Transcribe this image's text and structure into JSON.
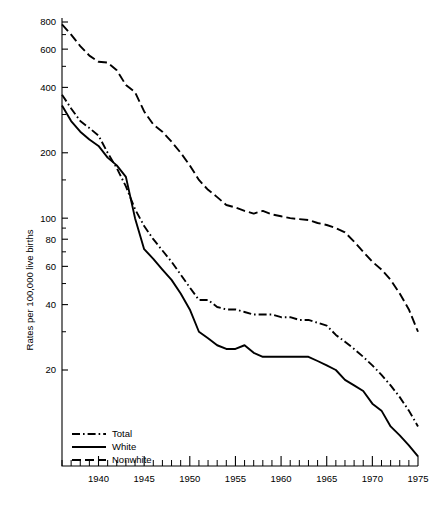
{
  "chart_data": {
    "type": "line",
    "title": "",
    "subtitle": "",
    "xlabel": "",
    "ylabel": "Rates per 100,000 live births",
    "yscale": "log",
    "ylim": [
      14,
      900
    ],
    "xlim": [
      1936,
      1975
    ],
    "grid": false,
    "legend_position": "bottom-left",
    "y_ticks_major": [
      800,
      600,
      400,
      200,
      100,
      80,
      60,
      40,
      20
    ],
    "y_tick_labels": [
      "800",
      "600",
      "400",
      "200",
      "100",
      "80",
      "60",
      "40",
      "20"
    ],
    "y_ticks_minor": [
      700,
      500,
      300,
      150,
      90,
      70,
      50,
      30
    ],
    "x_ticks_major": [
      1940,
      1945,
      1950,
      1955,
      1960,
      1965,
      1970,
      1975
    ],
    "x_tick_labels": [
      "1940",
      "1945",
      "1950",
      "1955",
      "1960",
      "1965",
      "1970",
      "1975"
    ],
    "x_tick_minor_step": 1,
    "x": [
      1936,
      1937,
      1938,
      1939,
      1940,
      1941,
      1942,
      1943,
      1944,
      1945,
      1946,
      1947,
      1948,
      1949,
      1950,
      1951,
      1952,
      1953,
      1954,
      1955,
      1956,
      1957,
      1958,
      1959,
      1960,
      1961,
      1962,
      1963,
      1964,
      1965,
      1966,
      1967,
      1968,
      1969,
      1970,
      1971,
      1972,
      1973,
      1974,
      1975
    ],
    "series": [
      {
        "name": "Total",
        "style": "dash-dot",
        "color": "#000000",
        "values": [
          370,
          320,
          280,
          260,
          240,
          200,
          170,
          140,
          110,
          92,
          80,
          71,
          63,
          55,
          48,
          42,
          42,
          39,
          38,
          38,
          37,
          36,
          36,
          36,
          35,
          35,
          34,
          34,
          33,
          32,
          29,
          27,
          25,
          23,
          21,
          19,
          17,
          15,
          13,
          11
        ]
      },
      {
        "name": "White",
        "style": "solid",
        "color": "#000000",
        "values": [
          330,
          280,
          250,
          230,
          215,
          190,
          175,
          155,
          100,
          72,
          65,
          58,
          52,
          45,
          38,
          30,
          28,
          26,
          25,
          25,
          26,
          24,
          23,
          23,
          23,
          23,
          23,
          23,
          22,
          21,
          20,
          18,
          17,
          16,
          14,
          13,
          11,
          10,
          9,
          8
        ]
      },
      {
        "name": "Nonwhite",
        "style": "dashed",
        "color": "#000000",
        "values": [
          780,
          700,
          620,
          560,
          525,
          520,
          480,
          410,
          380,
          310,
          270,
          250,
          225,
          200,
          175,
          150,
          135,
          125,
          115,
          112,
          108,
          105,
          108,
          104,
          102,
          100,
          99,
          98,
          95,
          93,
          90,
          86,
          78,
          70,
          63,
          58,
          52,
          45,
          38,
          30
        ]
      }
    ]
  },
  "legend": {
    "items": [
      {
        "label": "Total",
        "style": "dash-dot"
      },
      {
        "label": "White",
        "style": "solid"
      },
      {
        "label": "Nonwhite",
        "style": "dashed"
      }
    ]
  },
  "axes": {
    "y_title": "Rates per 100,000 live births"
  }
}
